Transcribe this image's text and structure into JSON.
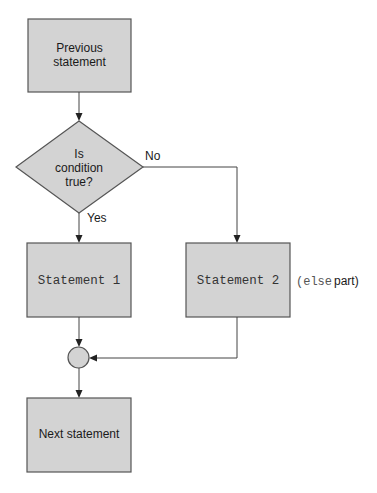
{
  "diagram": {
    "type": "flowchart",
    "colors": {
      "shape_fill": "#d3d3d3",
      "shape_stroke": "#555555",
      "line": "#444444",
      "text": "#1a1a1a"
    },
    "nodes": {
      "previous": {
        "line1": "Previous",
        "line2": "statement"
      },
      "decision": {
        "line1": "Is",
        "line2": "condition",
        "line3": "true?"
      },
      "statement1": {
        "label": "Statement 1"
      },
      "statement2": {
        "label": "Statement 2"
      },
      "else_note": {
        "code": "(else",
        "text": "part)"
      },
      "join": {
        "label": ""
      },
      "next": {
        "label": "Next statement"
      }
    },
    "edges": {
      "no_label": "No",
      "yes_label": "Yes"
    }
  }
}
